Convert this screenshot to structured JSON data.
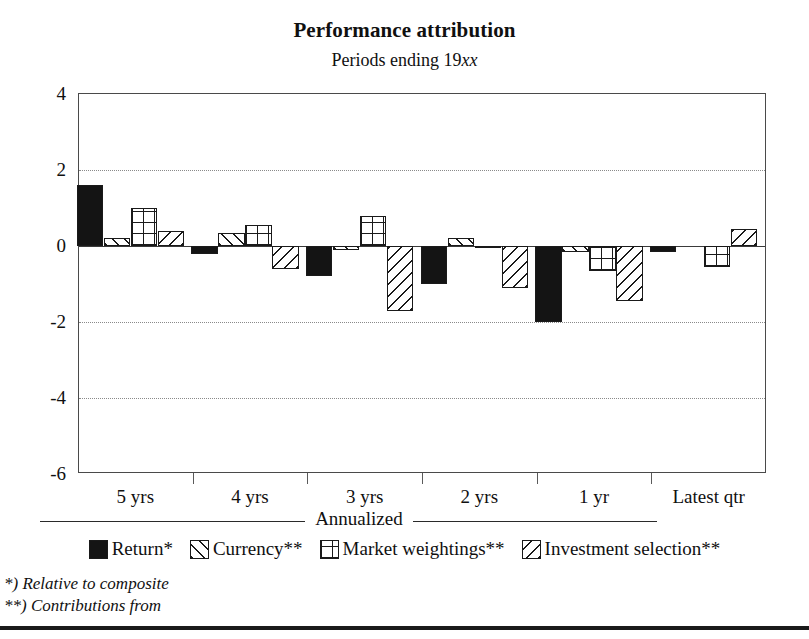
{
  "header": {
    "title": "Performance attribution",
    "subtitle_prefix": "Periods ending 19",
    "subtitle_italic": "xx"
  },
  "axis": {
    "y_ticks": [
      "4",
      "2",
      "0",
      "-2",
      "-4",
      "-6"
    ],
    "x_labels": [
      "5 yrs",
      "4 yrs",
      "3 yrs",
      "2 yrs",
      "1 yr",
      "Latest qtr"
    ],
    "annualized_label": "Annualized"
  },
  "legend": {
    "items": [
      {
        "label": "Return*",
        "pattern": "solid"
      },
      {
        "label": "Currency**",
        "pattern": "forward-diagonal"
      },
      {
        "label": "Market weightings**",
        "pattern": "grid"
      },
      {
        "label": "Investment selection**",
        "pattern": "backward-diagonal"
      }
    ]
  },
  "footnotes": {
    "one": "*) Relative to composite",
    "two": "**) Contributions from"
  },
  "chart_data": {
    "type": "bar",
    "title": "Performance attribution",
    "subtitle": "Periods ending 19xx",
    "xlabel": "",
    "ylabel": "",
    "ylim": [
      -6,
      4
    ],
    "yticks": [
      4,
      2,
      0,
      -2,
      -4,
      -6
    ],
    "grid": "horizontal-dotted",
    "legend_position": "below-axis",
    "categories": [
      "5 yrs",
      "4 yrs",
      "3 yrs",
      "2 yrs",
      "1 yr",
      "Latest qtr"
    ],
    "category_group": {
      "annualized": [
        "5 yrs",
        "4 yrs",
        "3 yrs",
        "2 yrs",
        "1 yr"
      ],
      "non_annualized": [
        "Latest qtr"
      ]
    },
    "series": [
      {
        "name": "Return*",
        "pattern": "solid",
        "values": [
          1.6,
          -0.2,
          -0.8,
          -1.0,
          -2.0,
          -0.15
        ]
      },
      {
        "name": "Currency**",
        "pattern": "forward-diagonal",
        "values": [
          0.2,
          0.35,
          -0.1,
          0.2,
          -0.15,
          0.0
        ]
      },
      {
        "name": "Market weightings**",
        "pattern": "grid",
        "values": [
          1.0,
          0.55,
          0.8,
          -0.05,
          -0.65,
          -0.55
        ]
      },
      {
        "name": "Investment selection**",
        "pattern": "backward-diagonal",
        "values": [
          0.4,
          -0.6,
          -1.7,
          -1.1,
          -1.45,
          0.45
        ]
      }
    ]
  }
}
